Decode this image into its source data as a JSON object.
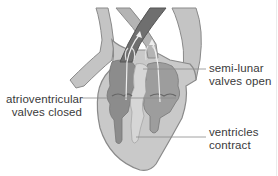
{
  "diagram": {
    "style": "grayscale illustration",
    "colors": {
      "background": "#ffffff",
      "outer_wall": "#c9c9c9",
      "wall_outline": "#8a8a8a",
      "chamber_dark": "#8c8c8c",
      "chamber_mid": "#a6a6a6",
      "septum_light": "#d6d6d6",
      "vessel_dark": "#6f6f6f",
      "arrow": "#eeeeee",
      "leader_line": "#8a8a8a",
      "label_text": "#3a3a3a"
    }
  },
  "labels": {
    "semilunar": {
      "line1": "semi-lunar",
      "line2": "valves open"
    },
    "atrioventricular": {
      "line1": "atrioventricular",
      "line2": "valves closed"
    },
    "ventricles": {
      "line1": "ventricles",
      "line2": "contract"
    }
  }
}
